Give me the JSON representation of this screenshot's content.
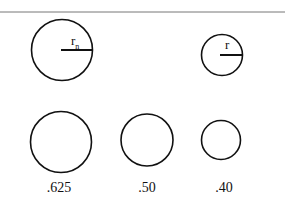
{
  "diagram": {
    "top_row": {
      "left_circle": {
        "label": "r",
        "subscript": "n"
      },
      "right_circle": {
        "label": "r"
      }
    },
    "bottom_row": {
      "labels": [
        ".625",
        ".50",
        ".40"
      ]
    },
    "colors": {
      "stroke": "#111111",
      "divider": "#777777"
    }
  }
}
